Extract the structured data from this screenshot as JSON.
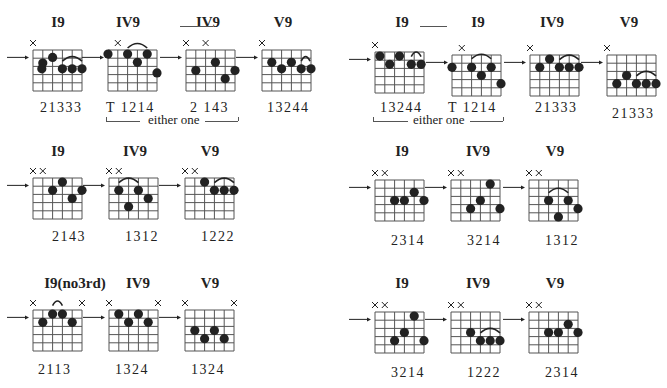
{
  "colors": {
    "ink": "#222222",
    "grid": "#555555",
    "background": "#ffffff"
  },
  "grid": {
    "width": 49,
    "height": 41,
    "strings": 6,
    "frets": 5
  },
  "connectors": [
    {
      "x1": 180,
      "x2": 213,
      "y": 26
    },
    {
      "x1": 420,
      "x2": 447,
      "y": 26
    }
  ],
  "either_labels": [
    {
      "text": "either one",
      "x": 148,
      "y": 121,
      "line_left": [
        106,
        140
      ],
      "line_right": [
        205,
        238
      ]
    },
    {
      "text": "either one",
      "x": 413,
      "y": 121,
      "line_left": [
        373,
        408
      ],
      "line_right": [
        470,
        503
      ]
    }
  ],
  "diagrams": [
    {
      "id": "d1",
      "title": "I9",
      "tx": 58,
      "ty": 14,
      "x": 33,
      "y": 50,
      "arrow": true,
      "xs": [
        0
      ],
      "dots": [
        [
          1,
          1.6
        ],
        [
          2,
          0.9
        ],
        [
          3,
          2.3
        ],
        [
          4,
          2.3
        ],
        [
          5,
          2.3
        ],
        [
          0.9,
          2.3
        ]
      ],
      "arcs": [
        [
          3,
          5,
          1.6
        ]
      ],
      "fingers": "21333",
      "fx": 40,
      "fy": 100
    },
    {
      "id": "d2",
      "title": "IV9",
      "tx": 128,
      "ty": 14,
      "x": 108,
      "y": 50,
      "arrow": true,
      "xs": [
        1
      ],
      "dots": [
        [
          0,
          0.5
        ],
        [
          2,
          0.5
        ],
        [
          3,
          1.5
        ],
        [
          4,
          0.5
        ],
        [
          5,
          2.8
        ]
      ],
      "arcs": [
        [
          2,
          4,
          0
        ]
      ],
      "fingers": "T 1214",
      "fx": 106,
      "fy": 100
    },
    {
      "id": "d3",
      "title": "IV9",
      "tx": 208,
      "ty": 14,
      "x": 186,
      "y": 50,
      "arrow": true,
      "xs": [
        0,
        2
      ],
      "dots": [
        [
          1,
          2.5
        ],
        [
          3,
          1.5
        ],
        [
          4,
          3.5
        ],
        [
          5,
          2.5
        ]
      ],
      "arcs": [],
      "fingers": "2  143",
      "fx": 190,
      "fy": 100
    },
    {
      "id": "d4",
      "title": "V9",
      "tx": 283,
      "ty": 14,
      "x": 262,
      "y": 50,
      "arrow": true,
      "xs": [
        0
      ],
      "dots": [
        [
          1,
          1.5
        ],
        [
          2,
          2.3
        ],
        [
          3,
          1.5
        ],
        [
          4,
          2.3
        ],
        [
          5,
          2.3
        ]
      ],
      "arcs": [
        [
          4,
          4.9,
          1.6
        ]
      ],
      "fingers": "13244",
      "fx": 267,
      "fy": 100
    },
    {
      "id": "d5",
      "title": "I9",
      "tx": 402,
      "ty": 14,
      "x": 375,
      "y": 52,
      "arrow": true,
      "xs": [
        0
      ],
      "dots": [
        [
          0.5,
          0.5
        ],
        [
          1.5,
          1.5
        ],
        [
          2.5,
          0.5
        ],
        [
          3.7,
          1.5
        ],
        [
          4.7,
          1.5
        ]
      ],
      "arcs": [
        [
          3.7,
          4.7,
          0.8
        ]
      ],
      "fingers": "13244",
      "fx": 380,
      "fy": 100
    },
    {
      "id": "d6",
      "title": "I9",
      "tx": 478,
      "ty": 14,
      "x": 452,
      "y": 55,
      "arrow": true,
      "xs": [
        1
      ],
      "dots": [
        [
          0,
          1.5
        ],
        [
          2,
          1.5
        ],
        [
          3,
          2.5
        ],
        [
          4,
          1.5
        ],
        [
          5,
          3.5
        ]
      ],
      "arcs": [
        [
          2,
          4,
          0.7
        ]
      ],
      "fingers": "T 1214",
      "fx": 448,
      "fy": 100
    },
    {
      "id": "d7",
      "title": "IV9",
      "tx": 552,
      "ty": 14,
      "x": 530,
      "y": 55,
      "arrow": true,
      "xs": [
        0
      ],
      "dots": [
        [
          1,
          1.5
        ],
        [
          2,
          0.5
        ],
        [
          3,
          1.5
        ],
        [
          4,
          1.5
        ],
        [
          5,
          1.5
        ]
      ],
      "arcs": [
        [
          3,
          5,
          0.8
        ]
      ],
      "fingers": "21333",
      "fx": 535,
      "fy": 100
    },
    {
      "id": "d8",
      "title": "V9",
      "tx": 629,
      "ty": 14,
      "x": 607,
      "y": 55,
      "arrow": true,
      "xs": [
        0
      ],
      "dots": [
        [
          1,
          3.5
        ],
        [
          2,
          2.5
        ],
        [
          3,
          3.5
        ],
        [
          4,
          3.5
        ],
        [
          5,
          3.5
        ]
      ],
      "arcs": [
        [
          3,
          5,
          2.8
        ]
      ],
      "fingers": "21333",
      "fx": 612,
      "fy": 106
    },
    {
      "id": "d9",
      "title": "I9",
      "tx": 58,
      "ty": 143,
      "x": 33,
      "y": 178,
      "arrow": true,
      "xs": [
        0,
        1
      ],
      "dots": [
        [
          2,
          1.5
        ],
        [
          3,
          0.5
        ],
        [
          4,
          2.5
        ],
        [
          5,
          1.5
        ]
      ],
      "arcs": [],
      "fingers": "2143",
      "fx": 52,
      "fy": 229
    },
    {
      "id": "d10",
      "title": "IV9",
      "tx": 135,
      "ty": 143,
      "x": 109,
      "y": 178,
      "arrow": true,
      "xs": [
        0,
        1
      ],
      "dots": [
        [
          1,
          1.5
        ],
        [
          3,
          1.5
        ],
        [
          4,
          2.5
        ],
        [
          2,
          3.5
        ]
      ],
      "arcs": [
        [
          1,
          3,
          0.8
        ]
      ],
      "fingers": "1312",
      "fx": 125,
      "fy": 229
    },
    {
      "id": "d11",
      "title": "V9",
      "tx": 210,
      "ty": 143,
      "x": 185,
      "y": 178,
      "arrow": true,
      "xs": [
        0,
        1
      ],
      "dots": [
        [
          2,
          0.5
        ],
        [
          3,
          1.5
        ],
        [
          4,
          1.5
        ],
        [
          5,
          1.5
        ]
      ],
      "arcs": [
        [
          3,
          5,
          0.8
        ]
      ],
      "fingers": "1222",
      "fx": 201,
      "fy": 229
    },
    {
      "id": "d12",
      "title": "I9",
      "tx": 402,
      "ty": 143,
      "x": 375,
      "y": 180,
      "arrow": true,
      "xs": [
        0,
        1
      ],
      "dots": [
        [
          2,
          2.5
        ],
        [
          3,
          2.5
        ],
        [
          4,
          1.5
        ],
        [
          5,
          2.5
        ]
      ],
      "arcs": [],
      "fingers": "2314",
      "fx": 391,
      "fy": 233
    },
    {
      "id": "d13",
      "title": "IV9",
      "tx": 478,
      "ty": 143,
      "x": 451,
      "y": 180,
      "arrow": true,
      "xs": [
        0,
        1
      ],
      "dots": [
        [
          2,
          3.5
        ],
        [
          3,
          2.5
        ],
        [
          4,
          0.5
        ],
        [
          5,
          3.5
        ]
      ],
      "arcs": [],
      "fingers": "3214",
      "fx": 467,
      "fy": 233
    },
    {
      "id": "d14",
      "title": "V9",
      "tx": 555,
      "ty": 143,
      "x": 529,
      "y": 180,
      "arrow": true,
      "xs": [
        0,
        1
      ],
      "dots": [
        [
          2,
          2.5
        ],
        [
          4,
          2.5
        ],
        [
          3,
          4.5
        ],
        [
          5,
          3.5
        ]
      ],
      "arcs": [
        [
          2,
          4,
          1.8
        ]
      ],
      "fingers": "1312",
      "fx": 545,
      "fy": 233
    },
    {
      "id": "d15",
      "title": "I9(no3rd)",
      "tx": 75,
      "ty": 275,
      "x": 33,
      "y": 310,
      "arrow": true,
      "xs": [
        0,
        5
      ],
      "dots": [
        [
          1,
          1.5
        ],
        [
          2,
          0.5
        ],
        [
          3,
          0.5
        ],
        [
          4,
          1.5
        ]
      ],
      "arcs": [
        [
          2,
          3,
          -0.3
        ]
      ],
      "fingers": "2113",
      "fx": 38,
      "fy": 362
    },
    {
      "id": "d16",
      "title": "IV9",
      "tx": 138,
      "ty": 275,
      "x": 109,
      "y": 310,
      "arrow": true,
      "xs": [
        0,
        5
      ],
      "dots": [
        [
          1,
          0.5
        ],
        [
          2,
          1.5
        ],
        [
          3,
          0.5
        ],
        [
          4,
          1.5
        ]
      ],
      "arcs": [],
      "fingers": "1324",
      "fx": 115,
      "fy": 362
    },
    {
      "id": "d17",
      "title": "V9",
      "tx": 210,
      "ty": 275,
      "x": 185,
      "y": 310,
      "arrow": true,
      "xs": [
        0,
        5
      ],
      "dots": [
        [
          1,
          2.5
        ],
        [
          2,
          3.5
        ],
        [
          3,
          2.5
        ],
        [
          4,
          3.5
        ]
      ],
      "arcs": [],
      "fingers": "1324",
      "fx": 191,
      "fy": 362
    },
    {
      "id": "d18",
      "title": "I9",
      "tx": 402,
      "ty": 275,
      "x": 375,
      "y": 312,
      "arrow": true,
      "xs": [
        0,
        1
      ],
      "dots": [
        [
          4,
          0.5
        ],
        [
          3,
          2.5
        ],
        [
          2,
          3.5
        ],
        [
          5,
          3.5
        ]
      ],
      "arcs": [],
      "fingers": "3214",
      "fx": 391,
      "fy": 365
    },
    {
      "id": "d19",
      "title": "IV9",
      "tx": 478,
      "ty": 275,
      "x": 451,
      "y": 312,
      "arrow": true,
      "xs": [
        0,
        1
      ],
      "dots": [
        [
          2,
          2.5
        ],
        [
          3,
          3.5
        ],
        [
          4,
          3.5
        ],
        [
          5,
          3.5
        ]
      ],
      "arcs": [
        [
          3,
          5,
          2.8
        ]
      ],
      "fingers": "1222",
      "fx": 467,
      "fy": 365
    },
    {
      "id": "d20",
      "title": "V9",
      "tx": 555,
      "ty": 275,
      "x": 529,
      "y": 312,
      "arrow": true,
      "xs": [
        0,
        1
      ],
      "dots": [
        [
          2,
          2.5
        ],
        [
          3,
          2.5
        ],
        [
          4,
          1.5
        ],
        [
          5,
          2.5
        ]
      ],
      "arcs": [],
      "fingers": "2314",
      "fx": 545,
      "fy": 365
    }
  ]
}
